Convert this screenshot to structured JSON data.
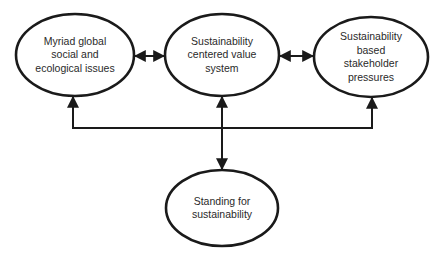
{
  "diagram": {
    "nodes": [
      {
        "id": "issues",
        "label": "Myriad global\nsocial and\necological issues"
      },
      {
        "id": "value_system",
        "label": "Sustainability\ncentered value\nsystem"
      },
      {
        "id": "stakeholder",
        "label": "Sustainability\nbased\nstakeholder\npressures"
      },
      {
        "id": "standing",
        "label": "Standing for\nsustainability"
      }
    ],
    "edges": [
      {
        "from": "issues",
        "to": "value_system",
        "type": "bidirectional"
      },
      {
        "from": "value_system",
        "to": "stakeholder",
        "type": "bidirectional"
      },
      {
        "from": "issues",
        "to": "stakeholder",
        "type": "bidirectional",
        "route": "below via horizontal connector"
      },
      {
        "from": "value_system",
        "to": "standing",
        "type": "bidirectional",
        "route": "vertical through connector"
      }
    ],
    "colors": {
      "stroke": "#1a1a1a",
      "text": "#2a2a2a",
      "background": "#ffffff"
    }
  }
}
